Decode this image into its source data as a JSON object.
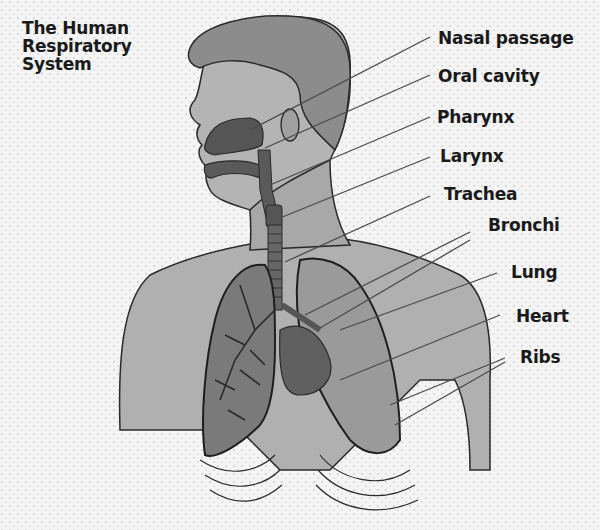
{
  "title": {
    "lines": [
      "The Human",
      "Respiratory",
      "System"
    ]
  },
  "labels": [
    {
      "text": "Nasal passage",
      "x": 438,
      "y": 28
    },
    {
      "text": "Oral cavity",
      "x": 438,
      "y": 66
    },
    {
      "text": "Pharynx",
      "x": 437,
      "y": 107
    },
    {
      "text": "Larynx",
      "x": 440,
      "y": 146
    },
    {
      "text": "Trachea",
      "x": 444,
      "y": 184
    },
    {
      "text": "Bronchi",
      "x": 488,
      "y": 215
    },
    {
      "text": "Lung",
      "x": 511,
      "y": 262
    },
    {
      "text": "Heart",
      "x": 516,
      "y": 306
    },
    {
      "text": "Ribs",
      "x": 520,
      "y": 347
    }
  ],
  "colors": {
    "skin": "#a8a8a8",
    "hair": "#8c8c8c",
    "airway": "#555555",
    "lung": "#7a7a7a",
    "outline": "#2a2a2a",
    "text": "#1a1a1a"
  }
}
